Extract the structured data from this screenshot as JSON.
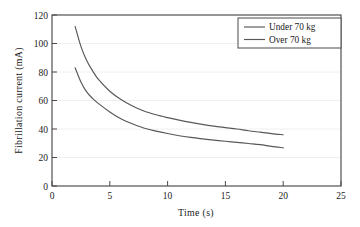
{
  "chart_data": {
    "type": "line",
    "title": "",
    "xlabel": "Time (s)",
    "ylabel": "Fibrillation  current (mA)",
    "xlim": [
      0,
      25
    ],
    "ylim": [
      0,
      120
    ],
    "xticks": [
      "0",
      "5",
      "10",
      "15",
      "20",
      "25"
    ],
    "xtick_values": [
      0,
      5,
      10,
      15,
      20,
      25
    ],
    "yticks": [
      "0",
      "20",
      "40",
      "60",
      "80",
      "100",
      "120"
    ],
    "ytick_values": [
      0,
      20,
      40,
      60,
      80,
      100,
      120
    ],
    "grid": "horizontal",
    "legend_position": "top-right",
    "x": [
      2,
      2.5,
      3,
      3.5,
      4,
      5,
      6,
      7,
      8,
      9,
      10,
      11,
      12,
      13,
      14,
      15,
      16,
      17,
      18,
      19,
      20
    ],
    "series": [
      {
        "name": "Under 70 kg",
        "values": [
          112,
          98,
          88,
          81,
          75,
          66.5,
          60.5,
          56,
          52.5,
          50,
          48,
          46.2,
          44.6,
          43.2,
          42,
          41,
          40,
          38.8,
          37.8,
          36.8,
          36
        ]
      },
      {
        "name": "Over 70 kg",
        "values": [
          83,
          73,
          66,
          61.5,
          58,
          52,
          47,
          43.5,
          40.5,
          38.5,
          36.8,
          35.3,
          34.1,
          33.1,
          32.2,
          31.4,
          30.6,
          29.8,
          29,
          27.8,
          26.8
        ]
      }
    ]
  },
  "legend": {
    "entries": [
      {
        "label": "Under 70 kg"
      },
      {
        "label": "Over 70 kg"
      }
    ]
  },
  "colors": {
    "line": "#585858",
    "frame": "#4a4a4a",
    "grid": "#ececec",
    "text": "#1a1a1a",
    "background": "#ffffff"
  }
}
